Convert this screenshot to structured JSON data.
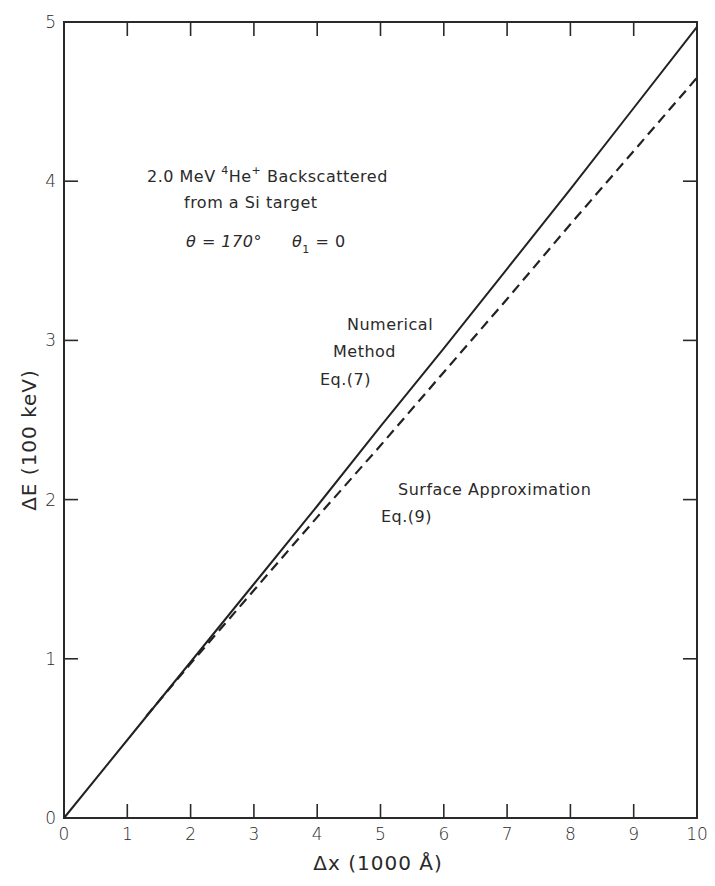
{
  "chart_data": {
    "type": "line",
    "title": "",
    "xlabel": "Δx (1000 Å)",
    "ylabel": "ΔE (100 keV)",
    "xlim": [
      0,
      10
    ],
    "ylim": [
      0,
      5
    ],
    "x_ticks": [
      "0",
      "1",
      "2",
      "3",
      "4",
      "5",
      "6",
      "7",
      "8",
      "9",
      "10"
    ],
    "y_ticks": [
      "0",
      "1",
      "2",
      "3",
      "4",
      "5"
    ],
    "grid": false,
    "legend": "none (inline annotations)",
    "series": [
      {
        "name": "Numerical Method Eq.(7)",
        "style": "solid",
        "x": [
          0,
          1,
          2,
          3,
          4,
          5,
          6,
          7,
          8,
          9,
          10
        ],
        "y": [
          0,
          0.49,
          0.98,
          1.47,
          1.96,
          2.46,
          2.95,
          3.45,
          3.95,
          4.46,
          4.97
        ]
      },
      {
        "name": "Surface Approximation Eq.(9)",
        "style": "dashed",
        "x": [
          1.3,
          2,
          3,
          4,
          5,
          6,
          7,
          8,
          9,
          10
        ],
        "y": [
          0.64,
          0.97,
          1.43,
          1.89,
          2.34,
          2.8,
          3.26,
          3.73,
          4.19,
          4.65
        ]
      }
    ],
    "annotations": [
      {
        "text": "2.0 MeV ⁴He⁺ Backscattered",
        "position": "upper-left"
      },
      {
        "text": "from a Si target",
        "position": "upper-left"
      },
      {
        "text": "θ = 170°    θ₁ = 0",
        "position": "upper-left"
      },
      {
        "text": "Numerical",
        "target": "solid line"
      },
      {
        "text": "Method",
        "target": "solid line"
      },
      {
        "text": "Eq.(7)",
        "target": "solid line"
      },
      {
        "text": "Surface Approximation",
        "target": "dashed line"
      },
      {
        "text": "Eq.(9)",
        "target": "dashed line"
      }
    ]
  },
  "labels": {
    "x_axis_title": "Δx  (1000 Å)",
    "y_axis_title": "ΔE  (100 keV)",
    "cond_line1_a": "2.0 MeV ",
    "cond_line1_sup4": "4",
    "cond_line1_he": "He",
    "cond_line1_supplus": "+",
    "cond_line1_b": " Backscattered",
    "cond_line2": "from a Si target",
    "cond_theta": "θ = 170°",
    "cond_theta1_a": "θ",
    "cond_theta1_sub": "1",
    "cond_theta1_b": " = 0",
    "num_line1": "Numerical",
    "num_line2": "Method",
    "num_line3": "Eq.(7)",
    "surf_line1": "Surface Approximation",
    "surf_line2": "Eq.(9)"
  }
}
